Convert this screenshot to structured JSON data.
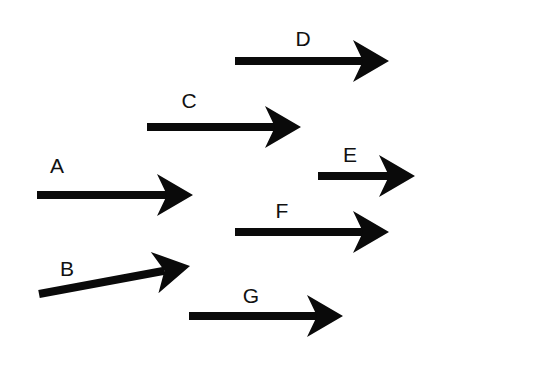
{
  "diagram": {
    "type": "vector arrows",
    "background": "#ffffff",
    "arrow_color": "#0a0a0a",
    "label_color": "#111111",
    "arrows": [
      {
        "label": "A",
        "x1": 37,
        "y1": 195,
        "x2": 193,
        "y2": 195,
        "label_x": 57,
        "label_y": 173
      },
      {
        "label": "B",
        "x1": 39,
        "y1": 294,
        "x2": 190,
        "y2": 266,
        "label_x": 67,
        "label_y": 276
      },
      {
        "label": "C",
        "x1": 147,
        "y1": 127,
        "x2": 301,
        "y2": 127,
        "label_x": 189,
        "label_y": 108
      },
      {
        "label": "D",
        "x1": 235,
        "y1": 61,
        "x2": 389,
        "y2": 61,
        "label_x": 303,
        "label_y": 46
      },
      {
        "label": "E",
        "x1": 318,
        "y1": 176,
        "x2": 415,
        "y2": 176,
        "label_x": 350,
        "label_y": 162
      },
      {
        "label": "F",
        "x1": 235,
        "y1": 232,
        "x2": 389,
        "y2": 232,
        "label_x": 282,
        "label_y": 218
      },
      {
        "label": "G",
        "x1": 189,
        "y1": 316,
        "x2": 343,
        "y2": 316,
        "label_x": 251,
        "label_y": 303
      }
    ]
  }
}
